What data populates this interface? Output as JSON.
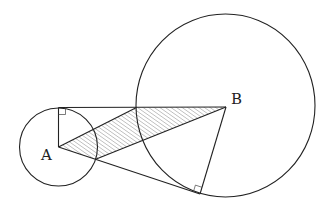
{
  "diagram": {
    "points": {
      "A": {
        "label": "A",
        "x": 58.5,
        "y": 147
      },
      "B": {
        "label": "B",
        "x": 226,
        "y": 107
      },
      "T": {
        "x": 58.5,
        "y": 107.5
      },
      "P": {
        "x": 136.5,
        "y": 107.5
      },
      "Q": {
        "x": 95.7,
        "y": 159.3
      },
      "C": {
        "x": 200,
        "y": 194
      }
    },
    "circles": [
      {
        "name": "circle-A",
        "cx": 58.5,
        "cy": 147,
        "r": 39
      },
      {
        "name": "circle-B",
        "cx": 225.5,
        "cy": 105.5,
        "rx": 89.5,
        "ry": 91.5
      }
    ],
    "shaded_region": [
      "A",
      "P",
      "B",
      "Q"
    ],
    "right_angles": [
      "T",
      "C"
    ],
    "colors": {
      "stroke": "#222222",
      "hatch": "#888888",
      "background": "#ffffff"
    }
  },
  "labels": {
    "A": "A",
    "B": "B"
  }
}
